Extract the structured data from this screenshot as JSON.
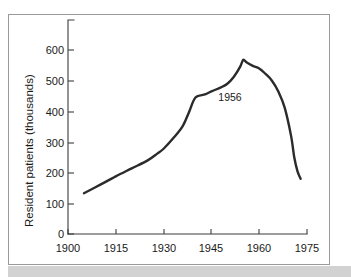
{
  "figure": {
    "background_color": "#ffffff",
    "frame_color": "#9a9a9a",
    "band_color": "#d2d2d2",
    "line_color": "#2b2b2b",
    "text_color": "#1a1a1a"
  },
  "chart_data": {
    "type": "line",
    "title": "",
    "xlabel": "",
    "ylabel": "Resident patients (thousands)",
    "xlim": [
      1900,
      1975
    ],
    "ylim": [
      0,
      650
    ],
    "xticks": [
      1900,
      1915,
      1930,
      1945,
      1960,
      1975
    ],
    "xtick_labels": [
      "1900",
      "1915",
      "1930",
      "1945",
      "1960",
      "1975"
    ],
    "yticks": [
      0,
      100,
      200,
      300,
      400,
      500,
      600
    ],
    "ytick_labels": [
      "0",
      "100",
      "200",
      "300",
      "400",
      "500",
      "600"
    ],
    "grid": false,
    "legend": null,
    "annotations": [
      {
        "text": "1956",
        "x": 1957,
        "y": 480
      }
    ],
    "series": [
      {
        "name": "Resident patients",
        "x": [
          1905,
          1910,
          1915,
          1920,
          1925,
          1928,
          1930,
          1933,
          1936,
          1938,
          1940,
          1943,
          1945,
          1948,
          1950,
          1952,
          1954,
          1955,
          1956,
          1958,
          1960,
          1962,
          1964,
          1966,
          1968,
          1970,
          1971,
          1972,
          1973
        ],
        "y": [
          133,
          160,
          188,
          214,
          240,
          262,
          278,
          312,
          352,
          398,
          445,
          455,
          465,
          478,
          490,
          512,
          545,
          568,
          560,
          548,
          540,
          522,
          500,
          465,
          412,
          320,
          250,
          205,
          180
        ]
      }
    ]
  }
}
